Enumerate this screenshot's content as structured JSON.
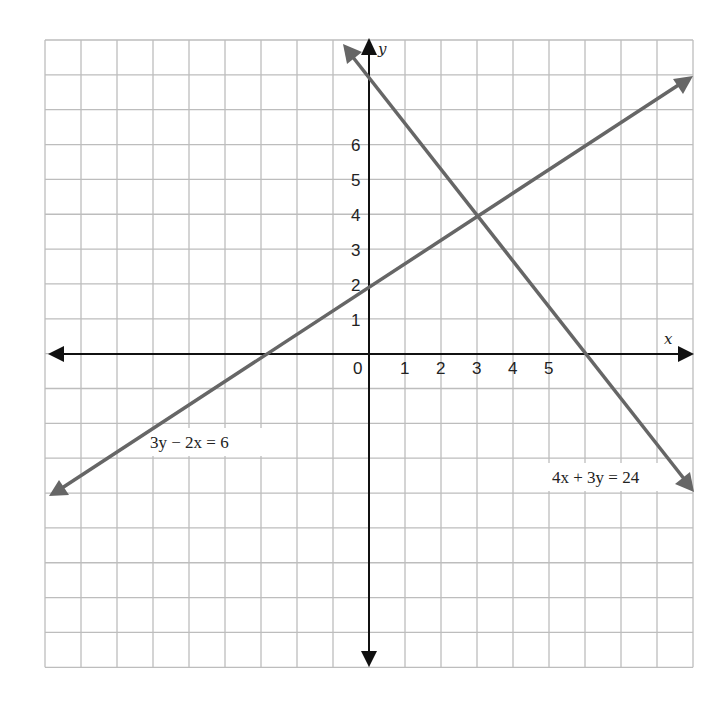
{
  "chart_data": {
    "type": "line",
    "title": "",
    "xlabel": "x",
    "ylabel": "y",
    "x_ticks": [
      "0",
      "1",
      "2",
      "3",
      "4",
      "5"
    ],
    "y_ticks": [
      "1",
      "2",
      "3",
      "4",
      "5",
      "6"
    ],
    "xlim": [
      -9,
      9
    ],
    "ylim": [
      -9,
      9
    ],
    "grid": true,
    "series": [
      {
        "name": "3y − 2x = 6",
        "equation": "3y - 2x = 6",
        "slope": 0.6667,
        "y_intercept": 2,
        "x_intercept": -3,
        "points": [
          [
            -9,
            -4
          ],
          [
            -3,
            0
          ],
          [
            0,
            2
          ],
          [
            3,
            4
          ],
          [
            9,
            8
          ]
        ],
        "color": "#666666"
      },
      {
        "name": "4x + 3y = 24",
        "equation": "4x + 3y = 24",
        "slope": -1.3333,
        "y_intercept": 8,
        "x_intercept": 6,
        "points": [
          [
            -0.7,
            8.9
          ],
          [
            0,
            8
          ],
          [
            3,
            4
          ],
          [
            6,
            0
          ],
          [
            9,
            -4
          ]
        ],
        "color": "#666666"
      }
    ],
    "intersection": [
      3,
      4
    ],
    "annotations": [
      {
        "text": "3y − 2x = 6",
        "near": [
          -6,
          -2.5
        ]
      },
      {
        "text": "4x + 3y = 24",
        "near": [
          7,
          -3.5
        ]
      }
    ]
  },
  "labels": {
    "x_axis": "x",
    "y_axis": "y",
    "origin": "0",
    "x_ticks": [
      "1",
      "2",
      "3",
      "4",
      "5"
    ],
    "y_ticks": [
      "1",
      "2",
      "3",
      "4",
      "5",
      "6"
    ],
    "eq1": "3y − 2x = 6",
    "eq2": "4x + 3y = 24"
  },
  "colors": {
    "grid": "#bdbdbd",
    "axis": "#111111",
    "line": "#666666"
  }
}
